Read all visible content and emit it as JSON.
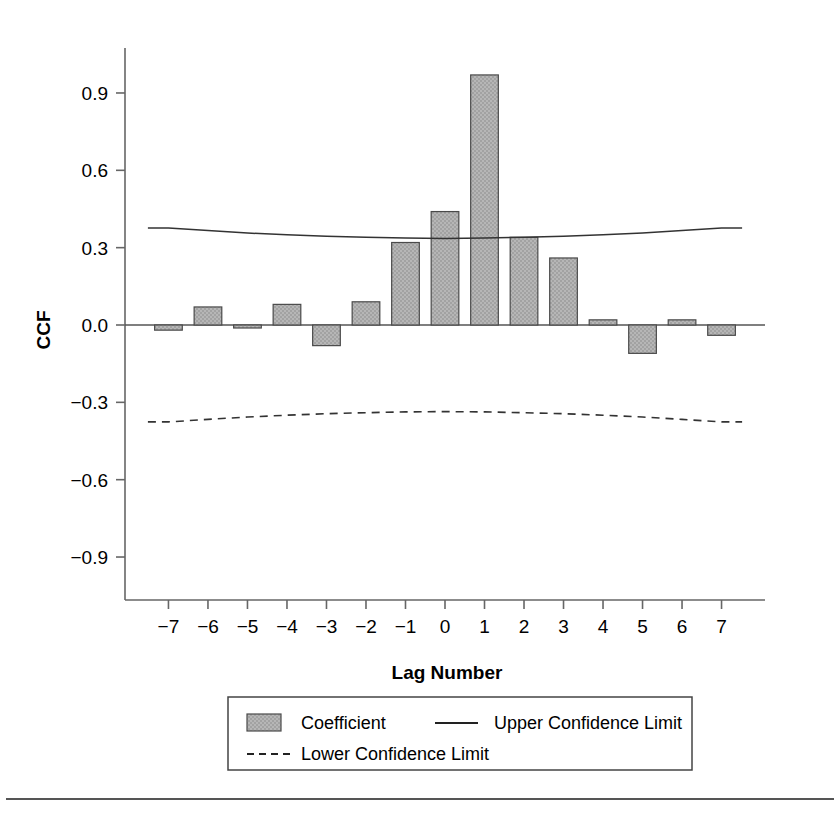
{
  "chart_data": {
    "type": "bar",
    "title": "",
    "subtitle": "",
    "xlabel": "Lag Number",
    "ylabel": "CCF",
    "categories": [
      -7,
      -6,
      -5,
      -4,
      -3,
      -2,
      -1,
      0,
      1,
      2,
      3,
      4,
      5,
      6,
      7
    ],
    "x_tick_labels": [
      "−7",
      "−6",
      "−5",
      "−4",
      "−3",
      "−2",
      "−1",
      "0",
      "1",
      "2",
      "3",
      "4",
      "5",
      "6",
      "7"
    ],
    "y_tick_labels": [
      "0.9",
      "0.6",
      "0.3",
      "0.0",
      "−0.3",
      "−0.6",
      "−0.9"
    ],
    "y_tick_values": [
      0.9,
      0.6,
      0.3,
      0.0,
      -0.3,
      -0.6,
      -0.9
    ],
    "ylim": [
      -1.08,
      1.06
    ],
    "xlim": [
      -7.7,
      7.7
    ],
    "grid": false,
    "legend_position": "bottom",
    "series": [
      {
        "name": "Coefficient",
        "kind": "bar",
        "values": [
          -0.02,
          0.07,
          -0.01,
          0.08,
          -0.08,
          0.09,
          0.32,
          0.44,
          0.97,
          0.34,
          0.26,
          0.02,
          -0.11,
          0.02,
          -0.04
        ]
      },
      {
        "name": "Upper Confidence Limit",
        "kind": "line",
        "style": "solid",
        "values": [
          0.376,
          0.366,
          0.357,
          0.35,
          0.344,
          0.34,
          0.337,
          0.336,
          0.337,
          0.34,
          0.344,
          0.35,
          0.357,
          0.366,
          0.376
        ]
      },
      {
        "name": "Lower Confidence Limit",
        "kind": "line",
        "style": "dashed",
        "values": [
          -0.376,
          -0.366,
          -0.357,
          -0.35,
          -0.344,
          -0.34,
          -0.337,
          -0.336,
          -0.337,
          -0.34,
          -0.344,
          -0.35,
          -0.357,
          -0.366,
          -0.376
        ]
      }
    ]
  },
  "legend": {
    "items": [
      {
        "label": "Coefficient",
        "marker": "bar-swatch"
      },
      {
        "label": "Upper Confidence Limit",
        "marker": "solid-line"
      },
      {
        "label": "Lower Confidence Limit",
        "marker": "dashed-line"
      }
    ]
  },
  "axes": {
    "y_title": "CCF",
    "x_title": "Lag Number"
  }
}
